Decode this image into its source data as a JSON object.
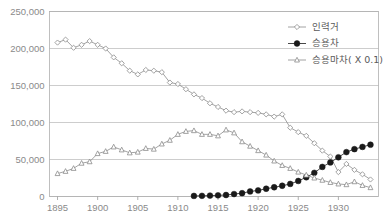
{
  "chart_data": {
    "type": "line",
    "title": "",
    "xlabel": "",
    "ylabel": "",
    "xlim": [
      1894,
      1935
    ],
    "ylim": [
      0,
      250000
    ],
    "grid": true,
    "legend_position": "top-right",
    "y_ticks": [
      0,
      50000,
      100000,
      150000,
      200000,
      250000
    ],
    "y_tick_labels": [
      "0",
      "50,000",
      "100,000",
      "150,000",
      "200,000",
      "250,000"
    ],
    "x_ticks": [
      1895,
      1900,
      1905,
      1910,
      1915,
      1920,
      1925,
      1930
    ],
    "x_tick_labels": [
      "1895",
      "1900",
      "1905",
      "1910",
      "1915",
      "1920",
      "1925",
      "1930"
    ],
    "series": [
      {
        "name": "인력거",
        "marker": "diamond-open",
        "color": "#8c8c8c",
        "x": [
          1895,
          1896,
          1897,
          1898,
          1899,
          1900,
          1901,
          1902,
          1903,
          1904,
          1905,
          1906,
          1907,
          1908,
          1909,
          1910,
          1911,
          1912,
          1913,
          1914,
          1915,
          1916,
          1917,
          1918,
          1919,
          1920,
          1921,
          1922,
          1923,
          1924,
          1925,
          1926,
          1927,
          1928,
          1929,
          1930,
          1931,
          1932,
          1933,
          1934
        ],
        "values": [
          208000,
          212000,
          201000,
          205000,
          210000,
          205000,
          200000,
          188000,
          180000,
          170000,
          165000,
          171000,
          170000,
          168000,
          154000,
          152000,
          145000,
          138000,
          133000,
          126000,
          121000,
          116000,
          114000,
          115000,
          114000,
          113000,
          111000,
          108000,
          111000,
          93000,
          87000,
          82000,
          72000,
          62000,
          54000,
          33000,
          44000,
          36000,
          30000,
          23000
        ]
      },
      {
        "name": "승용차",
        "marker": "circle-filled",
        "color": "#1a1a1a",
        "x": [
          1912,
          1913,
          1914,
          1915,
          1916,
          1917,
          1918,
          1919,
          1920,
          1921,
          1922,
          1923,
          1924,
          1925,
          1926,
          1927,
          1928,
          1929,
          1930,
          1931,
          1932,
          1933,
          1934
        ],
        "values": [
          800,
          900,
          1200,
          1600,
          2000,
          3300,
          4500,
          6800,
          8200,
          10500,
          12500,
          14500,
          17000,
          21000,
          26000,
          32000,
          40000,
          46000,
          53000,
          60000,
          64000,
          67000,
          70000
        ]
      },
      {
        "name": "승용마차( X 0.1)",
        "marker": "triangle-open",
        "color": "#8c8c8c",
        "x": [
          1895,
          1896,
          1897,
          1898,
          1899,
          1900,
          1901,
          1902,
          1903,
          1904,
          1905,
          1906,
          1907,
          1908,
          1909,
          1910,
          1911,
          1912,
          1913,
          1914,
          1915,
          1916,
          1917,
          1918,
          1919,
          1920,
          1921,
          1922,
          1923,
          1924,
          1925,
          1926,
          1927,
          1928,
          1929,
          1930,
          1931,
          1932,
          1933,
          1934
        ],
        "values": [
          31000,
          34000,
          38000,
          45000,
          47000,
          58000,
          61000,
          67000,
          63000,
          59000,
          60000,
          65000,
          64000,
          71000,
          76000,
          84000,
          88000,
          89000,
          84000,
          84000,
          82000,
          90000,
          86000,
          74000,
          68000,
          62000,
          56000,
          48000,
          42000,
          38000,
          33000,
          29000,
          25000,
          22000,
          19000,
          17000,
          16000,
          20000,
          15000,
          12000
        ]
      }
    ]
  }
}
